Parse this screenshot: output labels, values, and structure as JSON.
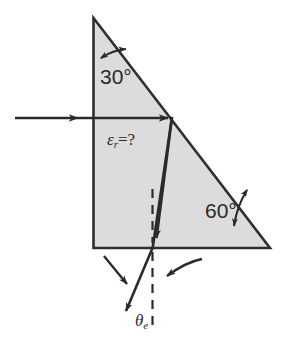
{
  "figure": {
    "type": "optics-ray-diagram",
    "background_color": "#ffffff",
    "prism": {
      "fill_color": "#dcdcdc",
      "stroke_color": "#2f2f2f",
      "apex_angle_label": "30°",
      "base_angle_label": "60°"
    },
    "labels": {
      "angle_top": "30°",
      "angle_bottom_right": "60°",
      "permittivity_symbol": "ε",
      "permittivity_subscript": "r",
      "permittivity_equals": "=",
      "permittivity_value": "?",
      "exit_angle_symbol": "θ",
      "exit_angle_subscript": "e"
    },
    "rays": {
      "incident_label": "incident-ray",
      "internal_label": "internal-refracted-ray",
      "exit_label": "exit-ray",
      "normal_label": "surface-normal-dashed"
    },
    "colors": {
      "ink": "#2a2a2a",
      "prism_fill": "#dcdcdc",
      "prism_edge": "#2f2f2f"
    }
  }
}
